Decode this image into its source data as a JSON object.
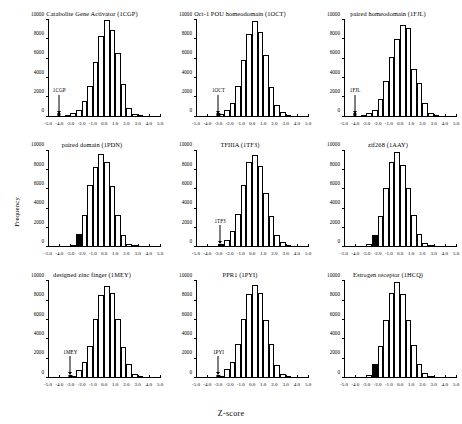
{
  "figure": {
    "xlabel": "Z-score",
    "ylabel": "Frequency"
  },
  "chart_data": {
    "type": "bar",
    "xlabel": "Z-score",
    "ylabel": "Frequency",
    "xlim": [
      -5.0,
      5.0
    ],
    "ylim": [
      0,
      10000
    ],
    "xticks": [
      "-5.0",
      "-4.0",
      "-3.0",
      "-2.0",
      "-1.0",
      "0.0",
      "1.0",
      "2.0",
      "3.0",
      "4.0",
      "5.0"
    ],
    "yticks": [
      "0",
      "2000",
      "4000",
      "6000",
      "8000",
      "10000"
    ],
    "bin_width": 0.5,
    "bin_left_edges": [
      -5.0,
      -4.5,
      -4.0,
      -3.5,
      -3.0,
      -2.5,
      -2.0,
      -1.5,
      -1.0,
      -0.5,
      0.0,
      0.5,
      1.0,
      1.5,
      2.0,
      2.5,
      3.0,
      3.5,
      4.0,
      4.5
    ],
    "grid": false,
    "legend": "none",
    "panels": [
      {
        "title": "Catabolite Gene Activator (1CGP)",
        "marker_label": "1CGP",
        "marker_z": -4.0,
        "marker_type": "arrow",
        "values": [
          0,
          0,
          0,
          120,
          400,
          700,
          1600,
          3200,
          5700,
          8300,
          10000,
          9000,
          6600,
          3400,
          900,
          280,
          60,
          0,
          0,
          0
        ]
      },
      {
        "title": "Oct-1 POU homeodomain (1OCT)",
        "marker_label": "1OCT",
        "marker_z": -3.0,
        "marker_type": "arrow",
        "values": [
          0,
          0,
          0,
          0,
          240,
          700,
          1450,
          3200,
          5900,
          8600,
          9900,
          8800,
          6400,
          3100,
          1200,
          450,
          120,
          0,
          0,
          0
        ]
      },
      {
        "title": "paired homeodomain (1FJL)",
        "marker_label": "1FJL",
        "marker_z": -4.0,
        "marker_type": "arrow",
        "values": [
          0,
          0,
          0,
          100,
          350,
          700,
          1800,
          3700,
          6200,
          8000,
          9500,
          9200,
          4900,
          3500,
          1400,
          330,
          60,
          0,
          0,
          0
        ]
      },
      {
        "title": "paired domain (1PDN)",
        "marker_label": "1PDN",
        "marker_z": -2.25,
        "marker_type": "filled-bar",
        "values": [
          0,
          0,
          0,
          0,
          250,
          1400,
          3300,
          6400,
          8300,
          9700,
          8800,
          6300,
          3300,
          1300,
          300,
          60,
          0,
          0,
          0,
          0
        ]
      },
      {
        "title": "TFIIIA (1TF3)",
        "marker_label": "1TF3",
        "marker_z": -2.85,
        "marker_type": "arrow-filled",
        "values": [
          0,
          0,
          0,
          0,
          350,
          800,
          1700,
          3400,
          6400,
          8800,
          9600,
          8400,
          5600,
          3200,
          1300,
          550,
          100,
          0,
          0,
          0
        ]
      },
      {
        "title": "zif268 (1AAY)",
        "marker_label": "1AAY",
        "marker_z": -2.25,
        "marker_type": "filled-bar",
        "values": [
          0,
          0,
          0,
          0,
          350,
          1300,
          3200,
          6100,
          8800,
          9900,
          8500,
          6100,
          3300,
          1400,
          450,
          120,
          0,
          0,
          0,
          0
        ]
      },
      {
        "title": "designed zinc finger (1MEY)",
        "marker_label": "1MEY",
        "marker_z": -3.0,
        "marker_type": "arrow",
        "values": [
          0,
          0,
          0,
          0,
          250,
          800,
          1700,
          3300,
          6100,
          8600,
          9500,
          8800,
          6100,
          3200,
          1400,
          450,
          120,
          0,
          0,
          0
        ]
      },
      {
        "title": "PPR1 (1PYI)",
        "marker_label": "1PYI",
        "marker_z": -3.0,
        "marker_type": "arrow",
        "values": [
          0,
          0,
          0,
          0,
          250,
          900,
          1700,
          3500,
          6100,
          8700,
          9600,
          8800,
          6000,
          3500,
          1300,
          450,
          100,
          0,
          0,
          0
        ]
      },
      {
        "title": "Estrogen receptor (1HCQ)",
        "marker_label": "1HCQ",
        "marker_z": -2.25,
        "marker_type": "filled-bar",
        "values": [
          0,
          0,
          0,
          0,
          350,
          1500,
          3300,
          6000,
          8800,
          9900,
          8700,
          6000,
          3400,
          1500,
          500,
          120,
          0,
          0,
          0,
          0
        ]
      }
    ]
  }
}
